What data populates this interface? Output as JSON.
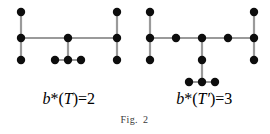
{
  "figure": {
    "label_prefix": "Fig.",
    "label_number": "2",
    "width": 269,
    "height": 134,
    "background": "#ffffff",
    "node_color": "#0d0d0d",
    "edge_color": "#9a9a9a",
    "node_radius": 4.2,
    "edge_width": 2.2
  },
  "captions": {
    "left": {
      "b": "b",
      "star": "*",
      "open": "(",
      "tree": "T",
      "prime": "",
      "close": ")",
      "equals": "=",
      "value": "2",
      "full_text": "b* (T) = 2"
    },
    "right": {
      "b": "b",
      "star": "*",
      "open": "(",
      "tree": "T",
      "prime": "′",
      "close": ")",
      "equals": "=",
      "value": "3",
      "full_text": "b* (T′) = 3"
    }
  },
  "graphs": [
    {
      "name": "tree-T",
      "caption_ref": "captions.left",
      "node_count": 9,
      "edge_count": 8,
      "branch_vertex_count": 2,
      "nodes": [
        {
          "id": "L1",
          "label": "",
          "x": 21,
          "y": 12
        },
        {
          "id": "L2",
          "label": "",
          "x": 21,
          "y": 38
        },
        {
          "id": "L3",
          "label": "",
          "x": 21,
          "y": 60
        },
        {
          "id": "L4",
          "label": "",
          "x": 68,
          "y": 38
        },
        {
          "id": "L5",
          "label": "",
          "x": 117,
          "y": 12
        },
        {
          "id": "L6",
          "label": "",
          "x": 117,
          "y": 38
        },
        {
          "id": "L7",
          "label": "",
          "x": 117,
          "y": 60
        },
        {
          "id": "L8",
          "label": "",
          "x": 55,
          "y": 60
        },
        {
          "id": "L9",
          "label": "",
          "x": 68,
          "y": 60
        },
        {
          "id": "L10",
          "label": "",
          "x": 81,
          "y": 60
        }
      ],
      "edges": [
        {
          "from": "L1",
          "to": "L2"
        },
        {
          "from": "L2",
          "to": "L3"
        },
        {
          "from": "L2",
          "to": "L4"
        },
        {
          "from": "L4",
          "to": "L6"
        },
        {
          "from": "L5",
          "to": "L6"
        },
        {
          "from": "L6",
          "to": "L7"
        },
        {
          "from": "L4",
          "to": "L9"
        },
        {
          "from": "L8",
          "to": "L9"
        },
        {
          "from": "L9",
          "to": "L10"
        }
      ]
    },
    {
      "name": "tree-T-prime",
      "caption_ref": "captions.right",
      "node_count": 12,
      "edge_count": 11,
      "branch_vertex_count": 3,
      "nodes": [
        {
          "id": "R1",
          "label": "",
          "x": 150,
          "y": 12
        },
        {
          "id": "R2",
          "label": "",
          "x": 150,
          "y": 38
        },
        {
          "id": "R3",
          "label": "",
          "x": 150,
          "y": 60
        },
        {
          "id": "R4",
          "label": "",
          "x": 176,
          "y": 38
        },
        {
          "id": "R5",
          "label": "",
          "x": 202,
          "y": 38
        },
        {
          "id": "R6",
          "label": "",
          "x": 228,
          "y": 38
        },
        {
          "id": "R7",
          "label": "",
          "x": 254,
          "y": 12
        },
        {
          "id": "R8",
          "label": "",
          "x": 254,
          "y": 38
        },
        {
          "id": "R9",
          "label": "",
          "x": 254,
          "y": 60
        },
        {
          "id": "R10",
          "label": "",
          "x": 202,
          "y": 60
        },
        {
          "id": "R11",
          "label": "",
          "x": 189,
          "y": 82
        },
        {
          "id": "R12",
          "label": "",
          "x": 202,
          "y": 82
        },
        {
          "id": "R13",
          "label": "",
          "x": 215,
          "y": 82
        }
      ],
      "edges": [
        {
          "from": "R1",
          "to": "R2"
        },
        {
          "from": "R2",
          "to": "R3"
        },
        {
          "from": "R2",
          "to": "R4"
        },
        {
          "from": "R4",
          "to": "R5"
        },
        {
          "from": "R5",
          "to": "R6"
        },
        {
          "from": "R6",
          "to": "R8"
        },
        {
          "from": "R7",
          "to": "R8"
        },
        {
          "from": "R8",
          "to": "R9"
        },
        {
          "from": "R5",
          "to": "R10"
        },
        {
          "from": "R10",
          "to": "R12"
        },
        {
          "from": "R11",
          "to": "R12"
        },
        {
          "from": "R12",
          "to": "R13"
        }
      ]
    }
  ]
}
